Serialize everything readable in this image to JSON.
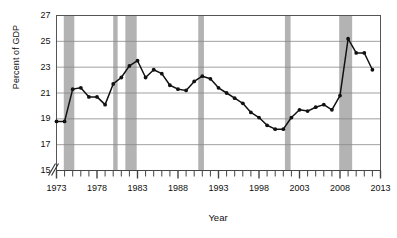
{
  "chart_data": {
    "type": "line",
    "title": "",
    "xlabel": "Year",
    "ylabel": "Percent of GDP",
    "xlim": [
      1973,
      2013
    ],
    "ylim": [
      15,
      27
    ],
    "ytick_values": [
      15,
      17,
      19,
      21,
      23,
      25,
      27
    ],
    "ytick_labels": [
      "15",
      "17",
      "19",
      "21",
      "23",
      "25",
      "27"
    ],
    "xtick_values": [
      1973,
      1978,
      1983,
      1988,
      1993,
      1998,
      2003,
      2008,
      2013
    ],
    "xtick_labels": [
      "1973",
      "1978",
      "1983",
      "1988",
      "1993",
      "1998",
      "2003",
      "2008",
      "2013"
    ],
    "minor_xticks": "every year 1973-2013",
    "grid": "horizontal",
    "axis_break": true,
    "legend": "none",
    "marker": "filled-circle",
    "line_color": "#111111",
    "band_color": "#b3b3b3",
    "grid_color": "#888888",
    "x": [
      1973,
      1974,
      1975,
      1976,
      1977,
      1978,
      1979,
      1980,
      1981,
      1982,
      1983,
      1984,
      1985,
      1986,
      1987,
      1988,
      1989,
      1990,
      1991,
      1992,
      1993,
      1994,
      1995,
      1996,
      1997,
      1998,
      1999,
      2000,
      2001,
      2002,
      2003,
      2004,
      2005,
      2006,
      2007,
      2008,
      2009,
      2010,
      2011,
      2012
    ],
    "values": [
      18.8,
      18.8,
      21.3,
      21.4,
      20.7,
      20.7,
      20.1,
      21.7,
      22.2,
      23.1,
      23.5,
      22.2,
      22.8,
      22.5,
      21.6,
      21.3,
      21.2,
      21.9,
      22.3,
      22.1,
      21.4,
      21.0,
      20.6,
      20.2,
      19.5,
      19.1,
      18.5,
      18.2,
      18.2,
      19.1,
      19.7,
      19.6,
      19.9,
      20.1,
      19.7,
      20.8,
      25.2,
      24.1,
      24.1,
      22.8
    ],
    "shaded_bands": [
      {
        "label": "recession",
        "start": 1973.9,
        "end": 1975.2
      },
      {
        "label": "recession",
        "start": 1980.0,
        "end": 1980.55
      },
      {
        "label": "recession",
        "start": 1981.5,
        "end": 1982.9
      },
      {
        "label": "recession",
        "start": 1990.5,
        "end": 1991.2
      },
      {
        "label": "recession",
        "start": 2001.2,
        "end": 2001.9
      },
      {
        "label": "recession",
        "start": 2007.9,
        "end": 2009.5
      }
    ]
  }
}
